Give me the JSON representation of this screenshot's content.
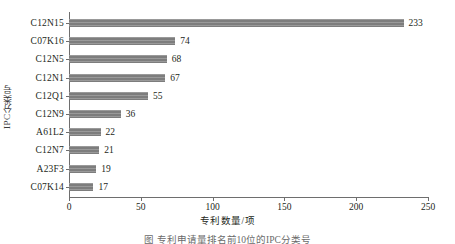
{
  "chart_data": {
    "type": "bar",
    "orientation": "horizontal",
    "title": "",
    "xlabel": "专利数量/项",
    "ylabel": "IPC分类号",
    "categories": [
      "C12N15",
      "C07K16",
      "C12N5",
      "C12N1",
      "C12Q1",
      "C12N9",
      "A61L2",
      "C12N7",
      "A23F3",
      "C07K14"
    ],
    "values": [
      233,
      74,
      68,
      67,
      55,
      36,
      22,
      21,
      19,
      17
    ],
    "xlim": [
      0,
      250
    ],
    "xticks": [
      0,
      50,
      100,
      150,
      200,
      250
    ],
    "xtick_labels": [
      "0",
      "50",
      "100",
      "150",
      "200",
      "250"
    ],
    "grid": false,
    "legend": null,
    "bar_color": "#7d7d7d",
    "axis_color": "#6e6e6e",
    "data_labels": [
      "233",
      "74",
      "68",
      "67",
      "55",
      "36",
      "22",
      "21",
      "19",
      "17"
    ]
  },
  "caption": "图 专利申请量排名前10位的IPC分类号"
}
